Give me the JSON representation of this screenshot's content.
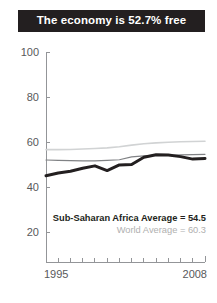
{
  "title": {
    "text": "The economy is 52.7% free"
  },
  "legend": {
    "africa_label": "Sub-Saharan Africa Average = 54.5",
    "world_label": "World Average = 60.3"
  },
  "colors": {
    "banner_bg": "#231f20",
    "banner_text": "#ffffff",
    "axis": "#939598",
    "tick_text": "#58595b",
    "country_line": "#231f20",
    "africa_line": "#808285",
    "world_line": "#d1d3d4",
    "legend_africa_text": "#231f20",
    "legend_world_text": "#b0b0b0",
    "background": "#ffffff"
  },
  "chart_data": {
    "type": "line",
    "title": "The economy is 52.7% free",
    "xlabel": "",
    "ylabel": "",
    "xlim": [
      1995,
      2008
    ],
    "ylim": [
      0,
      100
    ],
    "yticks": [
      20,
      40,
      60,
      80,
      100
    ],
    "xticks": [
      1995,
      2008
    ],
    "xtick_labels": [
      "1995",
      "2008"
    ],
    "grid": false,
    "legend_position": "inside-bottom-right",
    "x": [
      1995,
      1996,
      1997,
      1998,
      1999,
      2000,
      2001,
      2002,
      2003,
      2004,
      2005,
      2006,
      2007,
      2008
    ],
    "series": [
      {
        "name": "Country",
        "color": "#231f20",
        "width": 3,
        "values": [
          45.0,
          46.2,
          47.0,
          48.3,
          49.4,
          47.3,
          49.8,
          50.0,
          53.2,
          54.3,
          54.2,
          53.5,
          52.4,
          52.7
        ]
      },
      {
        "name": "Sub-Saharan Africa Average",
        "color": "#808285",
        "width": 1.2,
        "values": [
          52.0,
          51.8,
          51.7,
          51.6,
          51.6,
          51.8,
          52.1,
          53.4,
          53.8,
          54.0,
          54.1,
          54.3,
          54.4,
          54.5
        ]
      },
      {
        "name": "World Average",
        "color": "#d1d3d4",
        "width": 1.6,
        "values": [
          56.6,
          56.6,
          56.7,
          56.9,
          57.1,
          57.4,
          57.9,
          58.6,
          59.2,
          59.6,
          59.9,
          60.1,
          60.2,
          60.3
        ]
      }
    ]
  }
}
